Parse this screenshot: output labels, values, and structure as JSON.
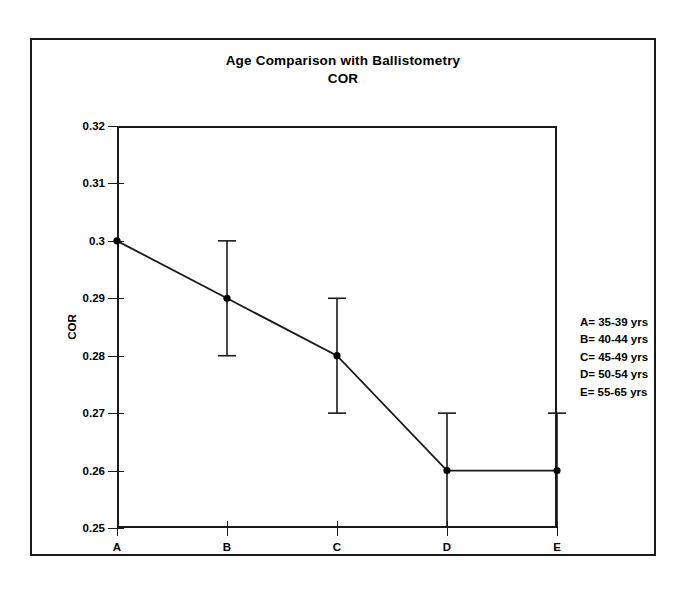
{
  "chart_data": {
    "type": "line",
    "title": "Age Comparison with Ballistometry",
    "subtitle": "COR",
    "xlabel": "",
    "ylabel": "COR",
    "categories": [
      "A",
      "B",
      "C",
      "D",
      "E"
    ],
    "values": [
      0.3,
      0.29,
      0.28,
      0.26,
      0.26
    ],
    "error_upper": [
      null,
      0.3,
      0.29,
      0.27,
      0.27
    ],
    "error_lower": [
      null,
      0.28,
      0.27,
      0.25,
      0.25
    ],
    "ylim": [
      0.25,
      0.32
    ],
    "yticks": [
      0.25,
      0.26,
      0.27,
      0.28,
      0.29,
      0.3,
      0.31,
      0.32
    ],
    "ytick_labels": [
      "0.25",
      "0.26",
      "0.27",
      "0.28",
      "0.29",
      "0.3",
      "0.31",
      "0.32"
    ],
    "grid": false,
    "legend_position": "right-outside",
    "series": [
      {
        "name": "COR",
        "values": [
          0.3,
          0.29,
          0.28,
          0.26,
          0.26
        ]
      }
    ],
    "annotations": [
      "A= 35-39 yrs",
      "B= 40-44 yrs",
      "C= 45-49 yrs",
      "D= 50-54 yrs",
      "E= 55-65 yrs"
    ]
  },
  "legend": {
    "entries": [
      {
        "text": "A= 35-39 yrs"
      },
      {
        "text": "B= 40-44 yrs"
      },
      {
        "text": "C= 45-49 yrs"
      },
      {
        "text": "D= 50-54 yrs"
      },
      {
        "text": "E= 55-65 yrs"
      }
    ]
  },
  "style": {
    "line_color": "#1a1a1a",
    "marker_color": "#000000",
    "frame_color": "#1a1a1a",
    "background": "#ffffff"
  }
}
